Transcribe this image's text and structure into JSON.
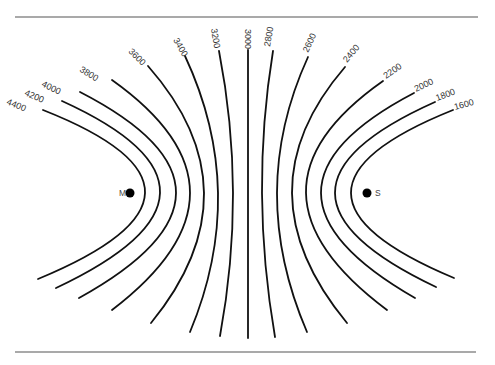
{
  "diagram": {
    "type": "contour-lines",
    "rules": {
      "top": {
        "x1": 15,
        "x2": 478,
        "y": 17
      },
      "bottom": {
        "x1": 15,
        "x2": 476,
        "y": 352
      }
    },
    "points": [
      {
        "label": "M",
        "x": 130,
        "y": 193,
        "label_x": 119,
        "label_y": 196
      },
      {
        "label": "S",
        "x": 367,
        "y": 193,
        "label_x": 375,
        "label_y": 196
      }
    ],
    "contours": [
      {
        "value": "4400",
        "d": "M43,110 Q249.5,191.5 38,279",
        "lx": 6,
        "ly": 104,
        "rot": 22
      },
      {
        "value": "4200",
        "d": "M62,101 Q261,191.5 56,288",
        "lx": 24,
        "ly": 95,
        "rot": 24
      },
      {
        "value": "4000",
        "d": "M80,92 Q272.5,191 79,298",
        "lx": 41,
        "ly": 86,
        "rot": 26
      },
      {
        "value": "3800",
        "d": "M112,80 Q268,191 112,310",
        "lx": 79,
        "ly": 71,
        "rot": 32
      },
      {
        "value": "3600",
        "d": "M148,66 Q258.5,191.5 151,323",
        "lx": 128,
        "ly": 52,
        "rot": 45
      },
      {
        "value": "3400",
        "d": "M185,56 Q248.5,192 190,332",
        "lx": 173,
        "ly": 40,
        "rot": 60
      },
      {
        "value": "3200",
        "d": "M219,51 Q246.5,192.5 220,336",
        "lx": 211,
        "ly": 29,
        "rot": 80
      },
      {
        "value": "3000",
        "d": "M248,50 L248,338",
        "lx": 245,
        "ly": 29,
        "rot": 90
      },
      {
        "value": "2800",
        "d": "M273,51 Q250,192 275,337",
        "lx": 270,
        "ly": 47,
        "rot": -80
      },
      {
        "value": "2600",
        "d": "M308,57 Q246.5,191.5 307,332",
        "lx": 308,
        "ly": 53,
        "rot": -65
      },
      {
        "value": "2400",
        "d": "M345,67 Q238,191 347,323",
        "lx": 347,
        "ly": 63,
        "rot": -50
      },
      {
        "value": "2200",
        "d": "M383,81 Q227,190.5 387,310",
        "lx": 386,
        "ly": 79,
        "rot": -35
      },
      {
        "value": "2000",
        "d": "M414,93 Q227.5,190.5 415,298",
        "lx": 416,
        "ly": 92,
        "rot": -25
      },
      {
        "value": "1800",
        "d": "M435,102 Q234.5,191.5 436,287",
        "lx": 437,
        "ly": 101,
        "rot": -20
      },
      {
        "value": "1600",
        "d": "M453,110 Q248.5,192 454,278",
        "lx": 455,
        "ly": 110,
        "rot": -15
      }
    ]
  }
}
